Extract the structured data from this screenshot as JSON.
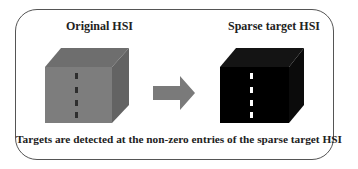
{
  "diagram": {
    "left_panel": {
      "title": "Original HSI",
      "cube_colors": {
        "front": "#7d7d7d",
        "top": "#6e6e6e",
        "side": "#6a6a6a",
        "targets": "#2e2e2e"
      }
    },
    "arrow": {
      "label": "",
      "color": "#7a7a7a"
    },
    "right_panel": {
      "title": "Sparse target HSI",
      "cube_colors": {
        "front": "#000000",
        "top": "#111111",
        "side": "#0b0b0b",
        "targets": "#ffffff"
      }
    },
    "caption": "Targets are detected at the non-zero entries of the sparse target HSI"
  }
}
